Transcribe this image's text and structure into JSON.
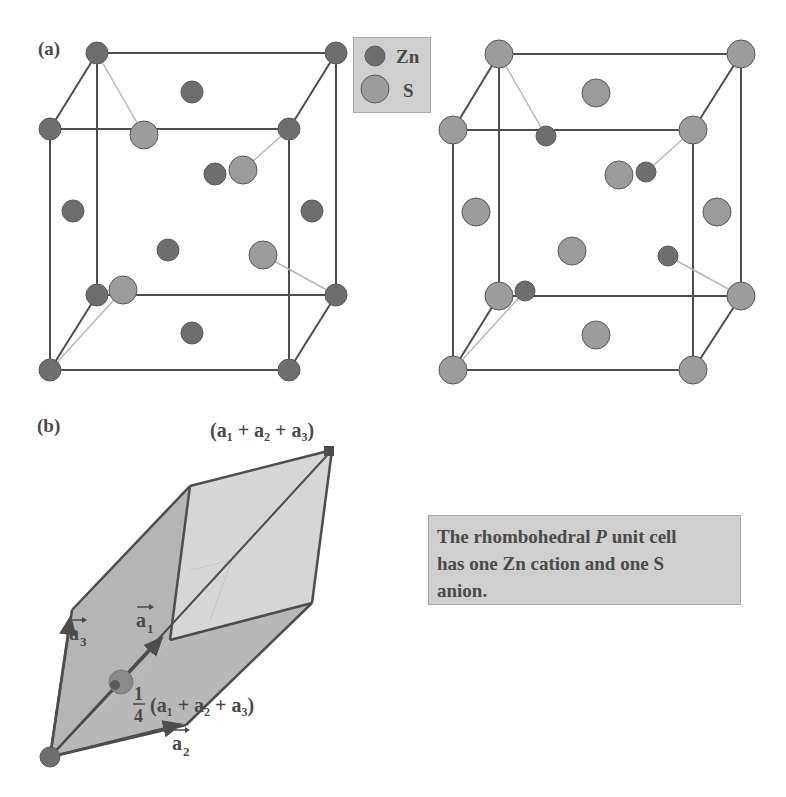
{
  "panel_a": {
    "label": "(a)",
    "legend": {
      "items": [
        {
          "symbol": "small-dark-circle",
          "label": "Zn",
          "color": "#6e6e6e"
        },
        {
          "symbol": "large-light-circle",
          "label": "S",
          "color": "#9c9c9c"
        }
      ]
    },
    "left_cube": {
      "corner_atom": "Zn",
      "face_center_atom": "Zn",
      "interior_atom": "S"
    },
    "right_cube": {
      "corner_atom": "S",
      "face_center_atom": "S",
      "interior_atom": "Zn"
    }
  },
  "panel_b": {
    "label": "(b)",
    "vector_labels": {
      "a1": "a",
      "a1_sub": "1",
      "a2": "a",
      "a2_sub": "2",
      "a3": "a",
      "a3_sub": "3",
      "body_diagonal": "(a₁ + a₂ + a₃)",
      "quarter_fraction_num": "1",
      "quarter_fraction_den": "4",
      "quarter_diagonal": "(a₁ + a₂ + a₃)"
    },
    "caption": {
      "line1_before": "The rhombohedral ",
      "line1_italic": "P",
      "line1_after": " unit cell",
      "line2": "has one Zn cation and one S",
      "line3": "anion."
    }
  },
  "colors": {
    "edge": "#4d4d4d",
    "thin_bond": "#b8b8b8",
    "zn_fill": "#6e6e6e",
    "s_fill": "#9c9c9c",
    "rhombo_face_dark": "#b5b5b5",
    "rhombo_face_light": "#d6d6d6",
    "label_text": "#4a4a4a"
  }
}
